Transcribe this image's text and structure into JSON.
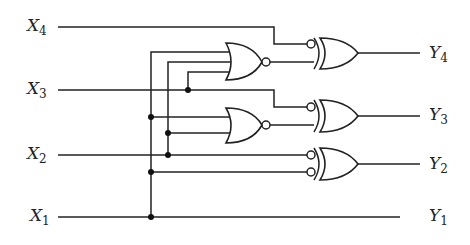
{
  "diagram": {
    "type": "logic-circuit",
    "inputs": [
      {
        "name": "X",
        "sub": "4",
        "y": 27
      },
      {
        "name": "X",
        "sub": "3",
        "y": 90
      },
      {
        "name": "X",
        "sub": "2",
        "y": 155
      },
      {
        "name": "X",
        "sub": "1",
        "y": 217
      }
    ],
    "outputs": [
      {
        "name": "Y",
        "sub": "4",
        "y": 52
      },
      {
        "name": "Y",
        "sub": "3",
        "y": 115
      },
      {
        "name": "Y",
        "sub": "2",
        "y": 165
      },
      {
        "name": "Y",
        "sub": "1",
        "y": 217
      }
    ],
    "gates": [
      {
        "id": "nor1",
        "kind": "NOR",
        "inputs": [
          "X1",
          "X2",
          "X3"
        ]
      },
      {
        "id": "nor2",
        "kind": "NOR",
        "inputs": [
          "X1",
          "X2"
        ]
      },
      {
        "id": "xnor4",
        "kind": "XOR with inverted input",
        "inputs": [
          "NOT X4",
          "nor1"
        ],
        "output": "Y4"
      },
      {
        "id": "xnor3",
        "kind": "XOR with inverted input",
        "inputs": [
          "NOT X3",
          "nor2"
        ],
        "output": "Y3"
      },
      {
        "id": "xor2",
        "kind": "XOR with two inverted inputs",
        "inputs": [
          "NOT X2",
          "NOT X1"
        ],
        "output": "Y2"
      }
    ],
    "passthrough": "X1 -> Y1",
    "colors": {
      "stroke": "#222222",
      "background": "#ffffff"
    }
  }
}
